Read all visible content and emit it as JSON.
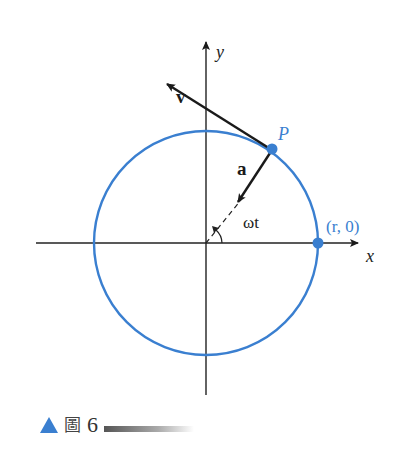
{
  "diagram": {
    "labels": {
      "y_axis": "y",
      "x_axis": "x",
      "velocity": "v",
      "acceleration": "a",
      "point": "P",
      "angle": "ωt",
      "start_point": "(r, 0)"
    },
    "colors": {
      "circle": "#3a7fd0",
      "axes": "#222222",
      "vectors": "#1a1a1a"
    }
  },
  "caption": {
    "figure_char": "圖",
    "figure_number": "6"
  }
}
